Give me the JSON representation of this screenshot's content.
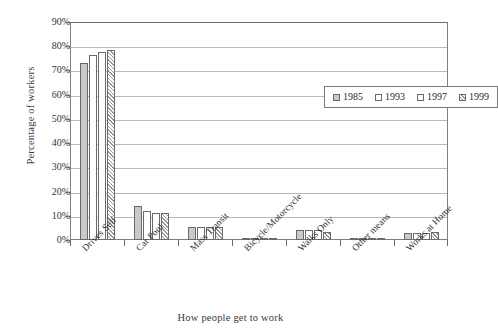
{
  "chart_data": {
    "type": "bar",
    "title": "",
    "xlabel": "How people get to work",
    "ylabel": "Percentage of workers",
    "ylim": [
      0,
      90
    ],
    "ytick_labels": [
      "90%",
      "80%",
      "70%",
      "60%",
      "50%",
      "40%",
      "30%",
      "20%",
      "10%",
      "0%"
    ],
    "ytick_values": [
      90,
      80,
      70,
      60,
      50,
      40,
      30,
      20,
      10,
      0
    ],
    "ytick_step": 10,
    "grid": "horizontal",
    "legend_position": "inside-upper-right",
    "categories": [
      "Drives Self",
      "Car Pool",
      "Mass Transit",
      "Bicycle/Motorcycle",
      "Walks Only",
      "Other means",
      "Works at Home"
    ],
    "series": [
      {
        "name": "1985",
        "fill": "solid-gray",
        "color": "#c9c9c9",
        "values": [
          73,
          14,
          5.5,
          1,
          4,
          1,
          3
        ]
      },
      {
        "name": "1993",
        "fill": "white",
        "color": "#ffffff",
        "values": [
          76.5,
          12,
          5.5,
          0.8,
          4,
          0.8,
          3
        ]
      },
      {
        "name": "1997",
        "fill": "white",
        "color": "#ffffff",
        "values": [
          77.5,
          11,
          5.5,
          0.7,
          4,
          0.7,
          3
        ]
      },
      {
        "name": "1999",
        "fill": "diagonal-hatch",
        "color": "#9a9a9a",
        "values": [
          78.5,
          11,
          5.5,
          0.7,
          3.5,
          0.7,
          3.5
        ]
      }
    ]
  },
  "legend": {
    "entries": [
      {
        "label": "1985"
      },
      {
        "label": "1993"
      },
      {
        "label": "1997"
      },
      {
        "label": "1999"
      }
    ]
  },
  "axes": {
    "y_title": "Percentage of workers",
    "x_title": "How people get to work"
  }
}
